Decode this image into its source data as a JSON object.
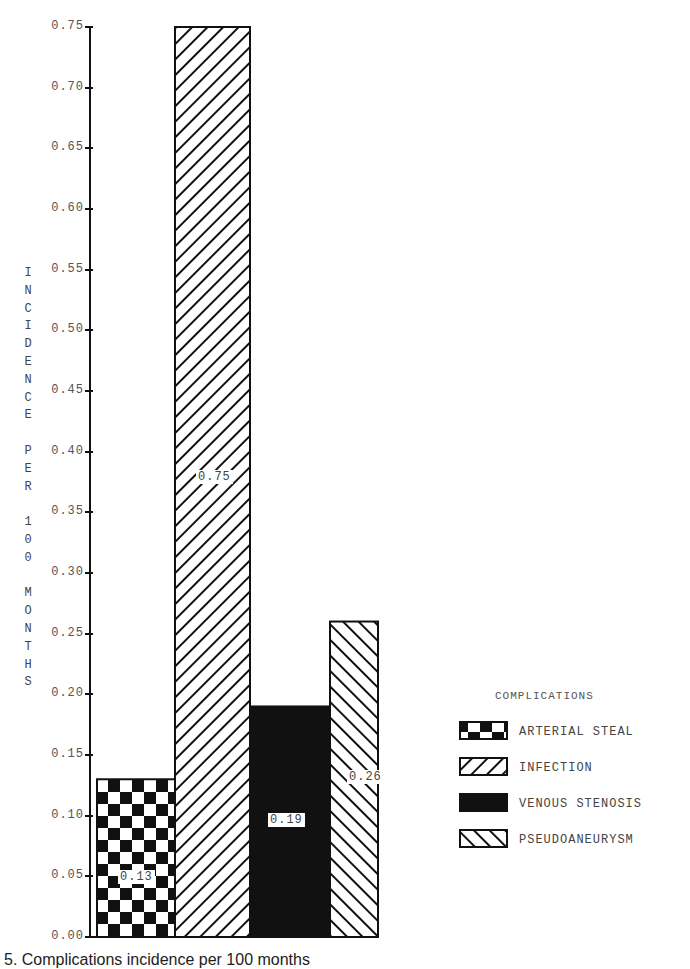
{
  "chart_data": {
    "type": "bar",
    "title": "",
    "xlabel": "",
    "ylabel": "INCIDENCE PER 100 MONTHS",
    "ylim": [
      0,
      0.75
    ],
    "yticks": [
      "0.00",
      "0.05",
      "0.10",
      "0.15",
      "0.20",
      "0.25",
      "0.30",
      "0.35",
      "0.40",
      "0.45",
      "0.50",
      "0.55",
      "0.60",
      "0.65",
      "0.70",
      "0.75"
    ],
    "categories": [
      "ARTERIAL STEAL",
      "INFECTION",
      "VENOUS STENOSIS",
      "PSEUDOANEURYSM"
    ],
    "values": [
      0.13,
      0.75,
      0.19,
      0.26
    ],
    "data_labels": [
      "0.13",
      "0.75",
      "0.19",
      "0.26"
    ],
    "patterns": [
      "checkerboard",
      "forward-diagonal-hatch",
      "solid-black",
      "backward-diagonal-hatch"
    ],
    "legend": {
      "title": "COMPLICATIONS",
      "position": "right",
      "entries": [
        "ARTERIAL STEAL",
        "INFECTION",
        "VENOUS STENOSIS",
        "PSEUDOANEURYSM"
      ]
    },
    "grid": false
  },
  "axis": {
    "ylabel_chars": [
      "I",
      "N",
      "C",
      "I",
      "D",
      "E",
      "N",
      "C",
      "E",
      "",
      "P",
      "E",
      "R",
      "",
      "1",
      "0",
      "0",
      "",
      "M",
      "O",
      "N",
      "T",
      "H",
      "S"
    ]
  },
  "caption": {
    "text": "5. Complications incidence per 100 months"
  }
}
